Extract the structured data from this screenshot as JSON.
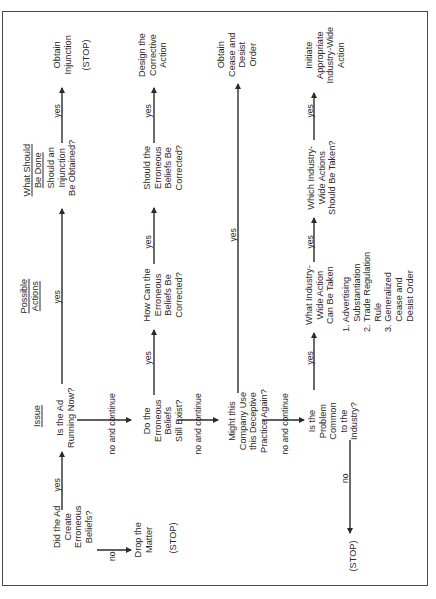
{
  "diagram": {
    "type": "flowchart",
    "orientation": "rotated-90-ccw",
    "column_headers": [
      {
        "id": "issue",
        "label": "Issue",
        "cx": 37,
        "cy": 416
      },
      {
        "id": "possible_actions",
        "lines": [
          "Possible",
          "Actions"
        ],
        "cx": 29,
        "cy": 296
      },
      {
        "id": "what_should_be_done",
        "lines": [
          "What Should",
          "Be Done"
        ],
        "cx": 32,
        "cy": 170
      }
    ],
    "nodes": [
      {
        "id": "did_ad_create",
        "lines": [
          "Did the Ad",
          "Create",
          "Erroneous",
          "Beliefs?"
        ],
        "cx": 73,
        "cy": 527
      },
      {
        "id": "drop_matter",
        "lines": [
          "Drop the",
          "Matter"
        ],
        "cx": 143,
        "cy": 540
      },
      {
        "id": "stop_1",
        "lines": [
          "(STOP)"
        ],
        "cx": 173,
        "cy": 538
      },
      {
        "id": "is_ad_running",
        "lines": [
          "Is the Ad",
          "Running Now?"
        ],
        "cx": 65,
        "cy": 418
      },
      {
        "id": "should_injunction",
        "lines": [
          "Should an",
          "Injunction",
          "Be Obtained?"
        ],
        "cx": 62,
        "cy": 168
      },
      {
        "id": "obtain_injunction",
        "lines": [
          "Obtain",
          "Injunction"
        ],
        "cx": 62,
        "cy": 55
      },
      {
        "id": "stop_2",
        "lines": [
          "(STOP)"
        ],
        "cx": 86,
        "cy": 55
      },
      {
        "id": "do_beliefs_exist",
        "lines": [
          "Do the",
          "Erroneous",
          "Beliefs",
          "Still Exist?"
        ],
        "cx": 163,
        "cy": 421
      },
      {
        "id": "how_correct",
        "lines": [
          "How Can the",
          "Erroneous",
          "Beliefs Be",
          "Corrected?"
        ],
        "cx": 163,
        "cy": 295
      },
      {
        "id": "should_correct",
        "lines": [
          "Should the",
          "Erroneous",
          "Beliefs Be",
          "Corrected?"
        ],
        "cx": 163,
        "cy": 168
      },
      {
        "id": "design_corrective",
        "lines": [
          "Design the",
          "Corrective",
          "Action"
        ],
        "cx": 153,
        "cy": 55
      },
      {
        "id": "might_company",
        "lines": [
          "Might this",
          "Company Use",
          "this Deceptive",
          "Practice Again?"
        ],
        "cx": 248,
        "cy": 421
      },
      {
        "id": "obtain_cease",
        "lines": [
          "Obtain",
          "Cease and",
          "Desist",
          "Order"
        ],
        "cx": 237,
        "cy": 55
      },
      {
        "id": "is_problem_common",
        "lines": [
          "Is the",
          "Problem",
          "Common",
          "to the",
          "Industry?"
        ],
        "cx": 333,
        "cy": 421
      },
      {
        "id": "what_industry_action",
        "lines": [
          "What Industry-",
          "Wide Action",
          "Can Be Taken"
        ],
        "cx": 320,
        "cy": 295
      },
      {
        "id": "which_industry_actions",
        "lines": [
          "Which Industry-",
          "Wide Actions",
          "Should Be Taken?"
        ],
        "cx": 322,
        "cy": 178
      },
      {
        "id": "initiate_action",
        "lines": [
          "Initiate",
          "Appropriate",
          "Industry-Wide",
          "Action"
        ],
        "cx": 325,
        "cy": 55
      },
      {
        "id": "stop_3",
        "lines": [
          "(STOP)"
        ],
        "cx": 353,
        "cy": 556
      }
    ],
    "options_list": {
      "cx": 378,
      "cy": 292,
      "lines": [
        "1. Advertising",
        "    Substantiation",
        "2. Trade Regulation",
        "    Rule",
        "3. Generalized",
        "    Cease and",
        "    Desist Order"
      ]
    },
    "edge_labels": [
      {
        "text": "yes",
        "cx": 57,
        "cy": 485
      },
      {
        "text": "no",
        "cx": 112,
        "cy": 556
      },
      {
        "text": "yes",
        "cx": 57,
        "cy": 297
      },
      {
        "text": "yes",
        "cx": 57,
        "cy": 111
      },
      {
        "text": "no and continue",
        "cx": 112,
        "cy": 424
      },
      {
        "text": "yes",
        "cx": 148,
        "cy": 358
      },
      {
        "text": "yes",
        "cx": 148,
        "cy": 242
      },
      {
        "text": "yes",
        "cx": 148,
        "cy": 111
      },
      {
        "text": "no and continue",
        "cx": 198,
        "cy": 424
      },
      {
        "text": "yes",
        "cx": 233,
        "cy": 235
      },
      {
        "text": "no and continue",
        "cx": 285,
        "cy": 424
      },
      {
        "text": "yes",
        "cx": 310,
        "cy": 358
      },
      {
        "text": "yes",
        "cx": 310,
        "cy": 242
      },
      {
        "text": "yes",
        "cx": 310,
        "cy": 111
      },
      {
        "text": "no",
        "cx": 345,
        "cy": 478
      }
    ],
    "edges": [
      {
        "from": "did_ad_create",
        "to": "is_ad_running",
        "label": "yes",
        "x1": 62,
        "y1": 510,
        "x2": 62,
        "y2": 452
      },
      {
        "from": "did_ad_create",
        "to": "drop_matter",
        "label": "no",
        "x1": 97,
        "y1": 550,
        "x2": 131,
        "y2": 550
      },
      {
        "from": "is_ad_running",
        "to": "should_injunction",
        "label": "yes",
        "x1": 62,
        "y1": 384,
        "x2": 62,
        "y2": 209
      },
      {
        "from": "should_injunction",
        "to": "obtain_injunction",
        "label": "yes",
        "x1": 62,
        "y1": 143,
        "x2": 62,
        "y2": 88
      },
      {
        "from": "is_ad_running",
        "to": "do_beliefs_exist",
        "label": "no and continue",
        "x1": 77,
        "y1": 420,
        "x2": 131,
        "y2": 420
      },
      {
        "from": "do_beliefs_exist",
        "to": "how_correct",
        "label": "yes",
        "x1": 154,
        "y1": 395,
        "x2": 154,
        "y2": 330
      },
      {
        "from": "how_correct",
        "to": "should_correct",
        "label": "yes",
        "x1": 154,
        "y1": 264,
        "x2": 154,
        "y2": 208
      },
      {
        "from": "should_correct",
        "to": "design_corrective",
        "label": "yes",
        "x1": 154,
        "y1": 143,
        "x2": 154,
        "y2": 88
      },
      {
        "from": "do_beliefs_exist",
        "to": "might_company",
        "label": "no and continue",
        "x1": 177,
        "y1": 420,
        "x2": 218,
        "y2": 420
      },
      {
        "from": "might_company",
        "to": "obtain_cease",
        "label": "yes",
        "x1": 238,
        "y1": 393,
        "x2": 238,
        "y2": 84
      },
      {
        "from": "might_company",
        "to": "is_problem_common",
        "label": "no and continue",
        "x1": 262,
        "y1": 420,
        "x2": 304,
        "y2": 420
      },
      {
        "from": "is_problem_common",
        "to": "what_industry_action",
        "label": "yes",
        "x1": 314,
        "y1": 390,
        "x2": 314,
        "y2": 333
      },
      {
        "from": "what_industry_action",
        "to": "which_industry_actions",
        "label": "yes",
        "x1": 314,
        "y1": 262,
        "x2": 314,
        "y2": 218
      },
      {
        "from": "which_industry_actions",
        "to": "initiate_action",
        "label": "yes",
        "x1": 314,
        "y1": 140,
        "x2": 314,
        "y2": 93
      },
      {
        "from": "is_problem_common",
        "to": "stop_3",
        "label": "no",
        "x1": 350,
        "y1": 440,
        "x2": 350,
        "y2": 533
      }
    ],
    "colors": {
      "ink": "#2a2a2a",
      "frame": "#4a4a4a",
      "background": "#ffffff"
    }
  }
}
